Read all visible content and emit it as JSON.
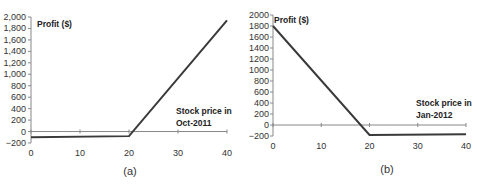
{
  "chart_data": [
    {
      "type": "line",
      "panel_label": "(a)",
      "ylabel": "Profit ($)",
      "xlabel": "Stock price in Oct-2011",
      "xlabel_lines": [
        "Stock price in",
        "Oct-2011"
      ],
      "xlim": [
        0,
        40
      ],
      "ylim": [
        -200,
        2000
      ],
      "xticks": [
        0,
        10,
        20,
        30,
        40
      ],
      "yticks": [
        -200,
        0,
        200,
        400,
        600,
        800,
        1000,
        1200,
        1400,
        1600,
        1800,
        2000
      ],
      "ytick_labels": [
        "−200",
        "0",
        "200",
        "400",
        "600",
        "800",
        "1,000",
        "1,200",
        "1,400",
        "1,600",
        "1,800",
        "2,000"
      ],
      "grid": false,
      "series": [
        {
          "name": "Profit",
          "x": [
            0,
            20,
            40
          ],
          "y": [
            -100,
            -80,
            1940
          ]
        }
      ]
    },
    {
      "type": "line",
      "panel_label": "(b)",
      "ylabel": "Profit ($)",
      "xlabel": "Stock price in Jan-2012",
      "xlabel_lines": [
        "Stock price in",
        "Jan-2012"
      ],
      "xlim": [
        0,
        40
      ],
      "ylim": [
        -200,
        2000
      ],
      "xticks": [
        0,
        10,
        20,
        30,
        40
      ],
      "yticks": [
        -200,
        0,
        200,
        400,
        600,
        800,
        1000,
        1200,
        1400,
        1600,
        1800,
        2000
      ],
      "ytick_labels": [
        "−200",
        "0",
        "200",
        "400",
        "600",
        "800",
        "1000",
        "1200",
        "1400",
        "1600",
        "1800",
        "2000"
      ],
      "grid": false,
      "series": [
        {
          "name": "Profit",
          "x": [
            0,
            20,
            40
          ],
          "y": [
            1800,
            -180,
            -170
          ]
        }
      ]
    }
  ],
  "colors": {
    "line": "#3a3a3a",
    "axis": "#888888",
    "text": "#333333"
  }
}
